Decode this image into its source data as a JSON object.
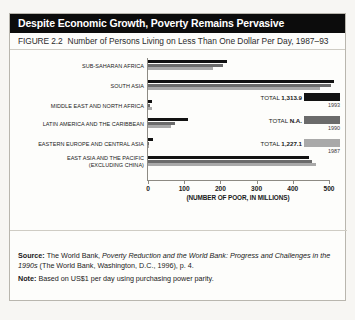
{
  "title": "Despite Economic Growth, Poverty Remains Pervasive",
  "figure_number": "FIGURE 2.2",
  "figure_caption": "Number of Persons Living on Less Than One Dollar Per Day, 1987–93",
  "footer": {
    "source_label": "Source:",
    "source_text_1": "The World Bank,",
    "source_italic_1": "Poverty Reduction and the World Bank: Progress and Challenges in the",
    "source_italic_2": "1990s",
    "source_text_2": "(The World Bank, Washington, D.C., 1996), p. 4.",
    "note_label": "Note:",
    "note_text": "Based on US$1 per day using purchasing power parity."
  },
  "legend": [
    {
      "year": "1993",
      "total_label": "TOTAL",
      "total_value": "1,313.9",
      "color": "#121212"
    },
    {
      "year": "1990",
      "total_label": "TOTAL",
      "total_value": "N.A.",
      "color": "#6b6b6b"
    },
    {
      "year": "1987",
      "total_label": "TOTAL",
      "total_value": "1,227.1",
      "color": "#a9a9a9"
    }
  ],
  "chart_data": {
    "type": "bar",
    "orientation": "horizontal",
    "title": "Number of Persons Living on Less Than One Dollar Per Day, 1987–93",
    "xlabel": "(NUMBER OF POOR, IN MILLIONS)",
    "ylabel": "",
    "xlim": [
      0,
      500
    ],
    "xticks": [
      0,
      100,
      200,
      300,
      400,
      500
    ],
    "xtick_labels": [
      "0",
      "100",
      "200",
      "300",
      "400",
      "500"
    ],
    "grid": false,
    "legend_position": "right",
    "categories": [
      "SUB-SAHARAN AFRICA",
      "SOUTH ASIA",
      "MIDDLE EAST AND NORTH AFRICA",
      "LATIN AMERICA AND THE CARIBBEAN",
      "EASTERN EUROPE AND CENTRAL ASIA",
      "EAST ASIA AND THE PACIFIC (EXCLUDING CHINA)"
    ],
    "category_lines": [
      [
        "SUB-SAHARAN AFRICA"
      ],
      [
        "SOUTH ASIA"
      ],
      [
        "MIDDLE EAST AND NORTH AFRICA"
      ],
      [
        "LATIN AMERICA AND THE CARIBBEAN"
      ],
      [
        "EASTERN EUROPE AND CENTRAL ASIA"
      ],
      [
        "EAST ASIA AND THE PACIFIC",
        "(EXCLUDING CHINA)"
      ]
    ],
    "series": [
      {
        "name": "1993",
        "color": "#121212",
        "values": [
          219,
          515,
          11,
          110,
          15,
          446
        ]
      },
      {
        "name": "1990",
        "color": "#6b6b6b",
        "values": [
          206,
          505,
          5,
          74,
          3,
          452
        ]
      },
      {
        "name": "1987",
        "color": "#a9a9a9",
        "values": [
          180,
          474,
          10,
          64,
          1,
          464
        ]
      }
    ],
    "totals": [
      {
        "year": "1993",
        "value": "1,313.9"
      },
      {
        "year": "1990",
        "value": "N.A."
      },
      {
        "year": "1987",
        "value": "1,227.1"
      }
    ]
  }
}
